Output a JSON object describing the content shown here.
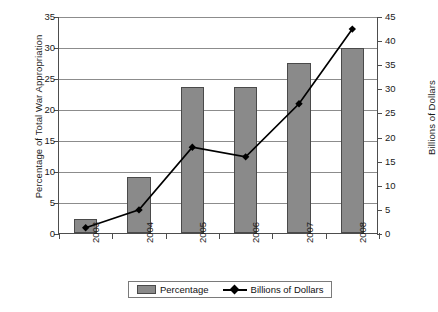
{
  "chart_data": {
    "type": "bar",
    "title": "",
    "subtitle": "",
    "xlabel": "",
    "ylabel": "Percentage of Total War Appropriation",
    "y2label": "Billions of Dollars",
    "categories": [
      "2003",
      "2004",
      "2005",
      "2006",
      "2007",
      "2008"
    ],
    "series": [
      {
        "name": "Percentage",
        "kind": "bar",
        "axis": "left",
        "color": "#8a8a8a",
        "values": [
          2.2,
          9.0,
          23.5,
          23.6,
          27.5,
          29.8
        ]
      },
      {
        "name": "Billions of Dollars",
        "kind": "line",
        "axis": "right",
        "color": "#000000",
        "marker": "diamond",
        "values": [
          1.3,
          5.0,
          18.0,
          16.0,
          27.0,
          42.5
        ]
      }
    ],
    "ylim": [
      0,
      35
    ],
    "yticks": [
      "0",
      "5",
      "10",
      "15",
      "20",
      "25",
      "30",
      "35"
    ],
    "y2lim": [
      0,
      45
    ],
    "y2ticks": [
      "0",
      "5",
      "10",
      "15",
      "20",
      "25",
      "30",
      "35",
      "40",
      "45"
    ],
    "grid": true,
    "grid_axis": "y",
    "legend_position": "bottom",
    "legend_entries": [
      "Percentage",
      "Billions of Dollars"
    ],
    "xtick_rotation": -90
  }
}
